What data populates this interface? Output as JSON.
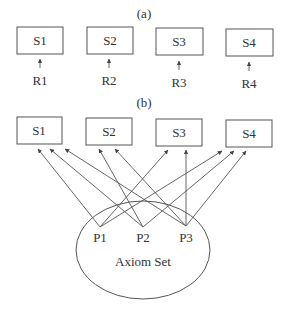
{
  "diagram": {
    "part_a": {
      "caption": "(a)",
      "systems": [
        {
          "label": "S1",
          "x": 17,
          "y": 27,
          "w": 46,
          "h": 27
        },
        {
          "label": "S2",
          "x": 87,
          "y": 27,
          "w": 46,
          "h": 27
        },
        {
          "label": "S3",
          "x": 156,
          "y": 28,
          "w": 47,
          "h": 27
        },
        {
          "label": "S4",
          "x": 226,
          "y": 29,
          "w": 47,
          "h": 27
        }
      ],
      "requirements": [
        {
          "label": "R1",
          "x": 40
        },
        {
          "label": "R2",
          "x": 109
        },
        {
          "label": "R3",
          "x": 179
        },
        {
          "label": "R4",
          "x": 249
        }
      ]
    },
    "part_b": {
      "caption": "(b)",
      "systems": [
        {
          "label": "S1",
          "x": 17,
          "y": 117,
          "w": 45,
          "h": 27
        },
        {
          "label": "S2",
          "x": 86,
          "y": 118,
          "w": 46,
          "h": 27
        },
        {
          "label": "S3",
          "x": 156,
          "y": 119,
          "w": 46,
          "h": 27
        },
        {
          "label": "S4",
          "x": 226,
          "y": 120,
          "w": 46,
          "h": 27
        }
      ],
      "principles": [
        {
          "label": "P1",
          "x": 100,
          "y": 227
        },
        {
          "label": "P2",
          "x": 143,
          "y": 227
        },
        {
          "label": "P3",
          "x": 186,
          "y": 226
        }
      ],
      "axiom_set": {
        "label": "Axiom Set",
        "cx": 143,
        "cy": 250,
        "rx": 67,
        "ry": 49
      },
      "edges": [
        {
          "from": "P1",
          "to": "S1",
          "tx": 38,
          "ty": 149
        },
        {
          "from": "P2",
          "to": "S1",
          "tx": 50,
          "ty": 149
        },
        {
          "from": "P3",
          "to": "S1",
          "tx": 65,
          "ty": 149
        },
        {
          "from": "P2",
          "to": "S2",
          "tx": 99,
          "ty": 149
        },
        {
          "from": "P3",
          "to": "S2",
          "tx": 115,
          "ty": 149
        },
        {
          "from": "P1",
          "to": "S3",
          "tx": 168,
          "ty": 150
        },
        {
          "from": "P3",
          "to": "S3",
          "tx": 186,
          "ty": 150
        },
        {
          "from": "P1",
          "to": "S4",
          "tx": 222,
          "ty": 151
        },
        {
          "from": "P2",
          "to": "S4",
          "tx": 234,
          "ty": 151
        },
        {
          "from": "P3",
          "to": "S4",
          "tx": 246,
          "ty": 151
        }
      ]
    }
  }
}
